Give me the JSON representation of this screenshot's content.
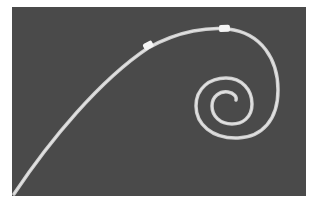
{
  "image": {
    "subject": "curved guidewire with spiral pigtail tip and two marker bands",
    "background_color": "#4a4a4a",
    "wire_color": "#d8d8d8",
    "marker_color": "#f4f4f4"
  }
}
